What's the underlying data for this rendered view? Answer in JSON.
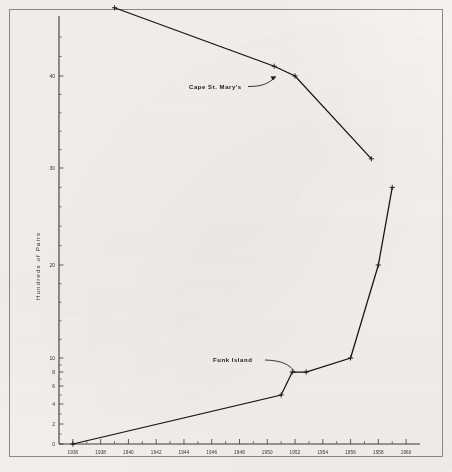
{
  "figure": {
    "background_color": "#f4f2ee",
    "ink_color": "#15130f",
    "frame_color": "#8d8b86",
    "media": "scanned-print-figure"
  },
  "chart_data": {
    "type": "line",
    "title": "",
    "subtitle": "",
    "xlabel": "",
    "ylabel": "Hundreds of Pairs",
    "xlim": [
      1935,
      1961
    ],
    "ylim": [
      0,
      48
    ],
    "grid": false,
    "legend_position": "inline-annotations",
    "y_scale": "broken-compressed",
    "x_tick_labels": [
      "1936",
      "1938",
      "1940",
      "1942",
      "1944",
      "1946",
      "1948",
      "1950",
      "1952",
      "1954",
      "1956",
      "1958",
      "1960"
    ],
    "x_tick_values": [
      1936,
      1938,
      1940,
      1942,
      1944,
      1946,
      1948,
      1950,
      1952,
      1954,
      1956,
      1958,
      1960
    ],
    "x_minor_tick_values": [
      1937,
      1939,
      1941,
      1943,
      1945,
      1947,
      1949,
      1951,
      1953,
      1955,
      1957,
      1959
    ],
    "y_tick_labels": [
      "0",
      "2",
      "4",
      "6",
      "8",
      "10",
      "20",
      "30",
      "40"
    ],
    "y_tick_values": [
      0,
      2,
      4,
      6,
      8,
      10,
      20,
      30,
      40
    ],
    "y_minor_tick_values": [
      1,
      3,
      5,
      7,
      9,
      12,
      14,
      16,
      18,
      22,
      24,
      26,
      28,
      32,
      34,
      36,
      38,
      42,
      44,
      46
    ],
    "series": [
      {
        "name": "Cape St. Mary's",
        "label": "Cape St. Mary's",
        "marker": "plus",
        "x": [
          1939,
          1950.5,
          1952,
          1957.5
        ],
        "y": [
          47,
          41,
          40,
          31
        ],
        "points": [
          {
            "x": 1939,
            "y": 47
          },
          {
            "x": 1950.5,
            "y": 41
          },
          {
            "x": 1952,
            "y": 40
          },
          {
            "x": 1957.5,
            "y": 31
          }
        ]
      },
      {
        "name": "Funk Island",
        "label": "Funk Island",
        "marker": "plus",
        "x": [
          1936,
          1951,
          1951.8,
          1952.8,
          1956,
          1958,
          1959
        ],
        "y": [
          0,
          5,
          8,
          8,
          10,
          20,
          28
        ],
        "points": [
          {
            "x": 1936,
            "y": 0
          },
          {
            "x": 1951,
            "y": 5
          },
          {
            "x": 1951.8,
            "y": 8
          },
          {
            "x": 1952.8,
            "y": 8
          },
          {
            "x": 1956,
            "y": 10
          },
          {
            "x": 1958,
            "y": 20
          },
          {
            "x": 1959,
            "y": 28
          }
        ]
      }
    ],
    "annotations": [
      {
        "text": "Cape St. Mary's",
        "target_series": "Cape St. Mary's"
      },
      {
        "text": "Funk Island",
        "target_series": "Funk Island"
      }
    ]
  }
}
